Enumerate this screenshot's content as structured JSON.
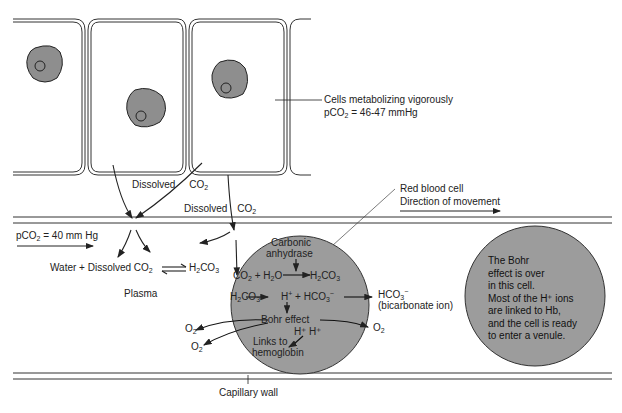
{
  "labels": {
    "cells_metabolizing": "Cells metabolizing vigorously",
    "pco2_cells_prefix": "pCO",
    "pco2_cells_sub": "2",
    "pco2_cells_value": " = 46-47 mmHg",
    "dissolved_1": "Dissolved",
    "co2_1": "CO",
    "co2_1_sub": "2",
    "dissolved_2": "Dissolved",
    "co2_2": "CO",
    "co2_2_sub": "2",
    "rbc": "Red blood cell",
    "direction": "Direction of movement",
    "pco2_plasma_prefix": "pCO",
    "pco2_plasma_sub": "2",
    "pco2_plasma_value": " = 40 mm Hg",
    "water_eq_a": "Water + Dissolved CO",
    "water_eq_sub": "2",
    "h2co3_a": "H",
    "h2co3_a_sub": "2",
    "h2co3_a_rest": "CO",
    "h2co3_a_sub2": "3",
    "plasma": "Plasma",
    "carbonic": "Carbonic",
    "anhydrase": "anhydrase",
    "rxn1_left": "CO",
    "rxn1_left_sub": "2",
    "rxn1_mid": " + H",
    "rxn1_mid_sub": "2",
    "rxn1_mid_rest": "O",
    "rxn1_right": "H",
    "rxn1_right_sub": "2",
    "rxn1_right_rest": "CO",
    "rxn1_right_sub2": "3",
    "rxn2_left": "H",
    "rxn2_left_sub": "2",
    "rxn2_left_rest": "CO",
    "rxn2_left_sub2": "3",
    "rxn2_h": "H",
    "rxn2_h_sup": "+",
    "rxn2_plus": "+ HCO",
    "rxn2_hco3_sub": "3",
    "rxn2_hco3_sup": "−",
    "hco3_out": "HCO",
    "hco3_out_sub": "3",
    "hco3_out_sup": "−",
    "bicarbonate": "(bicarbonate ion)",
    "bohr": "Bohr effect",
    "hh": "H⁺ H⁺",
    "links1": "Links to",
    "links2": "hemoglobin",
    "o2_left1": "O",
    "o2_left1_sub": "2",
    "o2_left2": "O",
    "o2_left2_sub": "2",
    "o2_right": "O",
    "o2_right_sub": "2",
    "capillary_wall": "Capillary wall"
  },
  "note": {
    "line1": "The Bohr",
    "line2": "effect is over",
    "line3": "in this cell.",
    "line4": "Most of the H⁺ ions",
    "line5": "are linked to Hb,",
    "line6": "and the cell is ready",
    "line7": "to enter a venule."
  },
  "colors": {
    "rbc_fill": "#9c9c9c",
    "nucleus_fill": "#8a8a8a",
    "line": "#222222"
  }
}
